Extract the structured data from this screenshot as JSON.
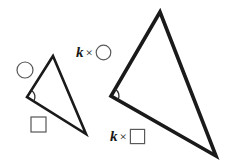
{
  "figure": {
    "background_color": "#ffffff",
    "stroke_color": "#1a1a1a",
    "marker_stroke_color": "#555555",
    "width": 230,
    "height": 163
  },
  "labels": {
    "k_symbol": "k",
    "times_symbol": "×",
    "k_times_circle": {
      "variable": "k",
      "operator": "×",
      "shape": "circle"
    },
    "k_times_square": {
      "variable": "k",
      "operator": "×",
      "shape": "square"
    }
  },
  "small_triangle": {
    "name": "small-triangle",
    "stroke_width": 2.6,
    "vertices": [
      {
        "name": "apex",
        "x": 53,
        "y": 56
      },
      {
        "name": "left",
        "x": 27,
        "y": 97
      },
      {
        "name": "bottom-right",
        "x": 86,
        "y": 134
      }
    ],
    "angle_marker": {
      "cx": 27,
      "cy": 97,
      "r": 8
    },
    "side_markers": [
      {
        "shape": "circle",
        "cx": 25,
        "cy": 70,
        "r": 8
      },
      {
        "shape": "square",
        "x": 31,
        "y": 117,
        "size": 15
      }
    ]
  },
  "large_triangle": {
    "name": "large-triangle",
    "stroke_width": 3.6,
    "vertices": [
      {
        "name": "apex",
        "x": 160,
        "y": 12
      },
      {
        "name": "left",
        "x": 111,
        "y": 96
      },
      {
        "name": "bottom-right",
        "x": 216,
        "y": 156
      }
    ],
    "angle_marker": {
      "cx": 111,
      "cy": 96,
      "r": 8
    }
  }
}
